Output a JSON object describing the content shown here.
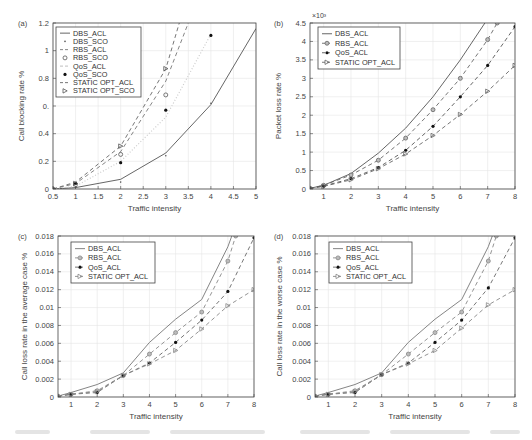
{
  "figure": {
    "caption_visible_text": ""
  },
  "chart_data": [
    {
      "id": "a",
      "panel_label": "(a)",
      "type": "line",
      "title": "",
      "xlabel": "Traffic intensity",
      "ylabel": "Call blocking rate %",
      "xlim": [
        0.5,
        5
      ],
      "ylim": [
        0,
        1.2
      ],
      "xticks": [
        0.5,
        1,
        1.5,
        2,
        2.5,
        3,
        3.5,
        4,
        4.5,
        5
      ],
      "xtick_labels": [
        "0.5",
        "1",
        "1.5",
        "2",
        "2.5",
        "3",
        "3.5",
        "4",
        "4.5",
        "5"
      ],
      "yticks": [
        0,
        0.2,
        0.4,
        0.6,
        0.8,
        1,
        1.2
      ],
      "ytick_labels": [
        "0",
        "0.2",
        "0.4",
        "0.",
        "0.8",
        "1",
        "1.2"
      ],
      "exponent_label": "",
      "grid": true,
      "legend_position": "top-left",
      "series": [
        {
          "name": "DBS_ACL",
          "style": "solid",
          "marker": "none",
          "color": "#555555",
          "x": [
            0.5,
            1,
            2,
            3,
            4,
            5
          ],
          "y": [
            0.0,
            0.01,
            0.07,
            0.26,
            0.61,
            1.16
          ]
        },
        {
          "name": "DBS_SCO",
          "style": "none",
          "marker": "dot",
          "color": "#555555",
          "x": [
            0.5,
            1,
            2,
            3,
            4
          ],
          "y": [
            0.0,
            0.01,
            0.05,
            0.24,
            0.62
          ]
        },
        {
          "name": "RBS_ACL",
          "style": "dash",
          "marker": "none",
          "color": "#777777",
          "x": [
            0.5,
            1,
            2,
            3,
            3.5
          ],
          "y": [
            0.0,
            0.04,
            0.27,
            0.78,
            1.2
          ]
        },
        {
          "name": "RBS_SCO",
          "style": "none",
          "marker": "circle-open",
          "color": "#555555",
          "x": [
            0.5,
            1,
            2,
            3
          ],
          "y": [
            0.0,
            0.03,
            0.25,
            0.68
          ]
        },
        {
          "name": "QoS_ACL",
          "style": "dotted-light",
          "marker": "none",
          "color": "#cccccc",
          "x": [
            0.5,
            1,
            2,
            3,
            4
          ],
          "y": [
            0.0,
            0.02,
            0.2,
            0.52,
            1.12
          ]
        },
        {
          "name": "QoS_SCO",
          "style": "none",
          "marker": "dot-filled",
          "color": "#222222",
          "x": [
            0.5,
            1,
            2,
            3,
            4
          ],
          "y": [
            0.0,
            0.04,
            0.19,
            0.57,
            1.11
          ]
        },
        {
          "name": "STATIC OPT_ACL",
          "style": "dash",
          "marker": "none",
          "color": "#666666",
          "x": [
            0.5,
            1,
            2,
            3,
            3.3
          ],
          "y": [
            0.0,
            0.05,
            0.31,
            0.87,
            1.2
          ]
        },
        {
          "name": "STATIC OPT_SCO",
          "style": "none",
          "marker": "triangle-right",
          "color": "#555555",
          "x": [
            0.5,
            1,
            2,
            3
          ],
          "y": [
            0.0,
            0.04,
            0.31,
            0.87
          ]
        }
      ]
    },
    {
      "id": "b",
      "panel_label": "(b)",
      "type": "line",
      "title": "",
      "xlabel": "Traffic intensity",
      "ylabel": "Packet loss rate %",
      "xlim": [
        0.5,
        8
      ],
      "ylim": [
        0,
        4.5
      ],
      "xticks": [
        1,
        2,
        3,
        4,
        5,
        6,
        7,
        8
      ],
      "xtick_labels": [
        "1",
        "2",
        "3",
        "4",
        "5",
        "6",
        "7",
        "8"
      ],
      "yticks": [
        0,
        0.5,
        1,
        1.5,
        2,
        2.5,
        3,
        3.5,
        4,
        4.5
      ],
      "ytick_labels": [
        "0",
        "0.5",
        "1",
        "1.5",
        "2",
        "2.5",
        "3",
        "3.5",
        "4",
        "4.5"
      ],
      "exponent_label": "×10³",
      "grid": true,
      "legend_position": "top-left",
      "series": [
        {
          "name": "DBS_ACL",
          "style": "solid",
          "marker": "none",
          "color": "#555555",
          "x": [
            0.5,
            1,
            2,
            3,
            4,
            5,
            6,
            6.9
          ],
          "y": [
            0.02,
            0.1,
            0.42,
            0.97,
            1.65,
            2.5,
            3.5,
            4.5
          ]
        },
        {
          "name": "RBS_ACL",
          "style": "dash",
          "marker": "circle-dot",
          "color": "#666666",
          "x": [
            0.5,
            1,
            2,
            3,
            4,
            5,
            6,
            7,
            7.35
          ],
          "y": [
            0.02,
            0.1,
            0.38,
            0.78,
            1.38,
            2.15,
            3.0,
            4.05,
            4.5
          ]
        },
        {
          "name": "QoS_ACL",
          "style": "dash",
          "marker": "dot-filled",
          "color": "#555555",
          "x": [
            0.5,
            1,
            2,
            3,
            4,
            5,
            6,
            7,
            8
          ],
          "y": [
            0.02,
            0.08,
            0.28,
            0.58,
            1.05,
            1.7,
            2.5,
            3.35,
            4.4
          ]
        },
        {
          "name": "STATIC OPT_ACL",
          "style": "dash",
          "marker": "triangle-right",
          "color": "#666666",
          "x": [
            0.5,
            1,
            2,
            3,
            4,
            5,
            6,
            7,
            8
          ],
          "y": [
            0.02,
            0.07,
            0.25,
            0.55,
            0.95,
            1.45,
            2.02,
            2.65,
            3.35
          ]
        }
      ]
    },
    {
      "id": "c",
      "panel_label": "(c)",
      "type": "line",
      "title": "",
      "xlabel": "Traffic intensity",
      "ylabel": "Call loss rate in the average case %",
      "xlim": [
        0.5,
        8
      ],
      "ylim": [
        0,
        0.018
      ],
      "xticks": [
        1,
        2,
        3,
        4,
        5,
        6,
        7,
        8
      ],
      "xtick_labels": [
        "1",
        "2",
        "3",
        "4",
        "5",
        "6",
        "7",
        "8"
      ],
      "yticks": [
        0,
        0.002,
        0.004,
        0.006,
        0.008,
        0.01,
        0.012,
        0.014,
        0.016,
        0.018
      ],
      "ytick_labels": [
        "0",
        "0.002",
        "0.004",
        "0.006",
        "0.008",
        "0.01",
        "0.012",
        "0.014",
        "0.016",
        "0.018"
      ],
      "exponent_label": "",
      "grid": true,
      "legend_position": "top-left",
      "series": [
        {
          "name": "DBS_ACL",
          "style": "solid",
          "marker": "none",
          "color": "#777777",
          "x": [
            0.5,
            1,
            2,
            3,
            4,
            5,
            6,
            7,
            7.15
          ],
          "y": [
            0.0001,
            0.0005,
            0.0014,
            0.0027,
            0.0061,
            0.0087,
            0.0109,
            0.0168,
            0.018
          ]
        },
        {
          "name": "RBS_ACL",
          "style": "dash",
          "marker": "circle-dot",
          "color": "#888888",
          "x": [
            0.5,
            1,
            2,
            3,
            4,
            5,
            6,
            7,
            7.3
          ],
          "y": [
            0.0001,
            0.0003,
            0.0007,
            0.0024,
            0.0048,
            0.0072,
            0.0095,
            0.0152,
            0.018
          ]
        },
        {
          "name": "QoS_ACL",
          "style": "dash",
          "marker": "dot-filled",
          "color": "#666666",
          "x": [
            0.5,
            1,
            2,
            3,
            4,
            5,
            6,
            7,
            8
          ],
          "y": [
            0.0001,
            0.0003,
            0.0005,
            0.0024,
            0.0038,
            0.0061,
            0.0086,
            0.0118,
            0.0178
          ]
        },
        {
          "name": "STATIC OPT_ACL",
          "style": "dash",
          "marker": "triangle-right",
          "color": "#888888",
          "x": [
            0.5,
            1,
            2,
            3,
            4,
            5,
            6,
            7,
            8
          ],
          "y": [
            0.0001,
            0.0003,
            0.0006,
            0.0024,
            0.0037,
            0.0052,
            0.0076,
            0.0102,
            0.012
          ]
        }
      ]
    },
    {
      "id": "d",
      "panel_label": "(d)",
      "type": "line",
      "title": "",
      "xlabel": "Traffic intensity",
      "ylabel": "Call loss rate in the worse case %",
      "xlim": [
        0.5,
        8
      ],
      "ylim": [
        0,
        0.018
      ],
      "xticks": [
        1,
        2,
        3,
        4,
        5,
        6,
        7,
        8
      ],
      "xtick_labels": [
        "1",
        "2",
        "3",
        "4",
        "5",
        "6",
        "7",
        "8"
      ],
      "yticks": [
        0,
        0.002,
        0.004,
        0.006,
        0.008,
        0.01,
        0.012,
        0.014,
        0.016,
        0.018
      ],
      "ytick_labels": [
        "0",
        "0.002",
        "0.004",
        "0.006",
        "0.008",
        "0.01",
        "0.012",
        "0.014",
        "0.016",
        "0.018"
      ],
      "exponent_label": "",
      "grid": true,
      "legend_position": "top-left",
      "series": [
        {
          "name": "DBS_ACL",
          "style": "solid",
          "marker": "none",
          "color": "#777777",
          "x": [
            0.5,
            1,
            2,
            3,
            4,
            5,
            6,
            7,
            7.15
          ],
          "y": [
            0.0001,
            0.0005,
            0.0014,
            0.0027,
            0.0061,
            0.0087,
            0.0109,
            0.0168,
            0.018
          ]
        },
        {
          "name": "RBS_ACL",
          "style": "dash",
          "marker": "circle-dot",
          "color": "#888888",
          "x": [
            0.5,
            1,
            2,
            3,
            4,
            5,
            6,
            7,
            7.3
          ],
          "y": [
            0.0001,
            0.0003,
            0.0007,
            0.0025,
            0.0048,
            0.0072,
            0.0095,
            0.0152,
            0.018
          ]
        },
        {
          "name": "QoS_ACL",
          "style": "dash",
          "marker": "dot-filled",
          "color": "#666666",
          "x": [
            0.5,
            1,
            2,
            3,
            4,
            5,
            6,
            7,
            8
          ],
          "y": [
            0.0001,
            0.0003,
            0.0005,
            0.0025,
            0.0038,
            0.0061,
            0.0086,
            0.0122,
            0.0178
          ]
        },
        {
          "name": "STATIC OPT_ACL",
          "style": "dash",
          "marker": "triangle-right",
          "color": "#888888",
          "x": [
            0.5,
            1,
            2,
            3,
            4,
            5,
            6,
            7,
            8
          ],
          "y": [
            0.0001,
            0.0003,
            0.0006,
            0.0025,
            0.0037,
            0.0052,
            0.0077,
            0.0103,
            0.012
          ]
        }
      ]
    }
  ]
}
